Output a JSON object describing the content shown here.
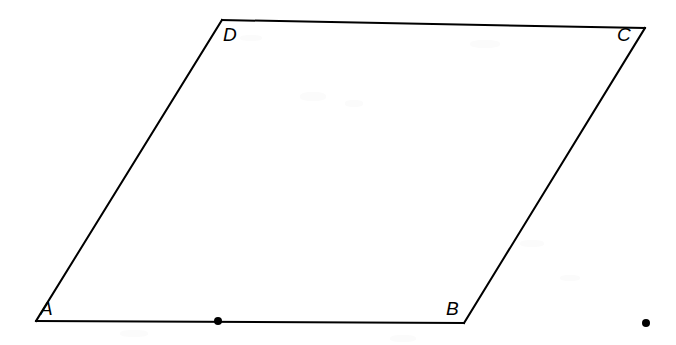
{
  "figure": {
    "type": "geometry-diagram",
    "shape": "parallelogram",
    "canvas": {
      "width": 676,
      "height": 345
    },
    "background_color": "#ffffff",
    "stroke_color": "#000000",
    "stroke_width": 2,
    "vertices": [
      {
        "name": "A",
        "label": "A",
        "x": 36,
        "y": 321,
        "label_x": 40,
        "label_y": 299
      },
      {
        "name": "B",
        "label": "B",
        "x": 464,
        "y": 323,
        "label_x": 446,
        "label_y": 299
      },
      {
        "name": "C",
        "label": "C",
        "x": 645,
        "y": 28,
        "label_x": 617,
        "label_y": 25
      },
      {
        "name": "D",
        "label": "D",
        "x": 222,
        "y": 20,
        "label_x": 223,
        "label_y": 25
      }
    ],
    "edges": [
      {
        "name": "AB",
        "from": "A",
        "to": "B"
      },
      {
        "name": "BC",
        "from": "B",
        "to": "C"
      },
      {
        "name": "CD",
        "from": "C",
        "to": "D"
      },
      {
        "name": "DA",
        "from": "D",
        "to": "A"
      }
    ],
    "points": [
      {
        "name": "midpoint-on-AB",
        "x": 218,
        "y": 321,
        "radius": 4,
        "color": "#000000",
        "on_edge": "AB"
      },
      {
        "name": "isolated-point-right",
        "x": 646,
        "y": 323,
        "radius": 4,
        "color": "#000000",
        "on_edge": null
      }
    ],
    "speckles": [
      {
        "x": 300,
        "y": 92,
        "w": 26,
        "h": 9
      },
      {
        "x": 345,
        "y": 100,
        "w": 18,
        "h": 7
      },
      {
        "x": 470,
        "y": 40,
        "w": 30,
        "h": 8
      },
      {
        "x": 240,
        "y": 35,
        "w": 22,
        "h": 6
      },
      {
        "x": 520,
        "y": 240,
        "w": 24,
        "h": 7
      },
      {
        "x": 560,
        "y": 275,
        "w": 20,
        "h": 6
      },
      {
        "x": 120,
        "y": 330,
        "w": 28,
        "h": 7
      },
      {
        "x": 390,
        "y": 335,
        "w": 26,
        "h": 7
      }
    ]
  }
}
